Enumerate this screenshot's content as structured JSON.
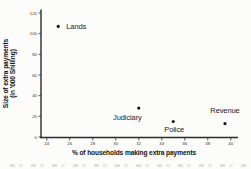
{
  "chart_data": {
    "type": "scatter",
    "title": "",
    "xlabel": "% of households making extra payments",
    "ylabel_line1": "Size of extra payments",
    "ylabel_line2": "(in '000 Shilling)",
    "xlim": [
      23.5,
      40.5
    ],
    "ylim": [
      0,
      120
    ],
    "x_ticks": [
      24,
      26,
      28,
      30,
      32,
      34,
      36,
      38,
      40
    ],
    "y_ticks": [
      0,
      20,
      40,
      60,
      80,
      100,
      120
    ],
    "grid": false,
    "legend": false,
    "points": [
      {
        "name": "Lands",
        "x": 25,
        "y": 107,
        "label_anchor": "start",
        "label_dx": 8,
        "label_dy": 2.5
      },
      {
        "name": "Judiciary",
        "x": 32,
        "y": 28,
        "label_anchor": "end",
        "label_dx": 3,
        "label_dy": 12
      },
      {
        "name": "Police",
        "x": 35,
        "y": 15,
        "label_anchor": "middle",
        "label_dx": 1,
        "label_dy": 10.5
      },
      {
        "name": "Revenue",
        "x": 39.5,
        "y": 13,
        "label_anchor": "middle",
        "label_dx": 0,
        "label_dy": -11
      }
    ],
    "colors": {
      "marker": "#141414",
      "axis": "#2b2b2b",
      "tick_label": "#333333",
      "point_label": "#1c1c1c",
      "axis_title": "#111111",
      "background": "#fcfcfb"
    }
  }
}
